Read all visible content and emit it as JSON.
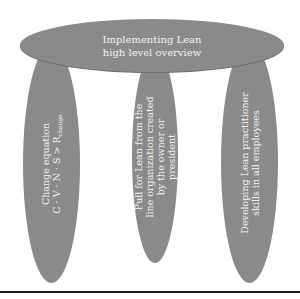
{
  "diagram": {
    "roof": {
      "lines": [
        "Implementing Lean",
        "high level overview"
      ]
    },
    "pillars": [
      {
        "lines": [
          "Change equation",
          "C · V · N · S > R"
        ],
        "subscript": "change"
      },
      {
        "lines": [
          "Pull for Lean from the",
          "line organization created",
          "by the owner or",
          "president"
        ]
      },
      {
        "lines": [
          "Developing Lean practitioner",
          "skills in all employees"
        ]
      }
    ],
    "colors": {
      "shape_fill": "#8a8a8a",
      "text": "#f2f2f2",
      "baseline": "#1a1a1a",
      "background": "#ffffff"
    }
  }
}
